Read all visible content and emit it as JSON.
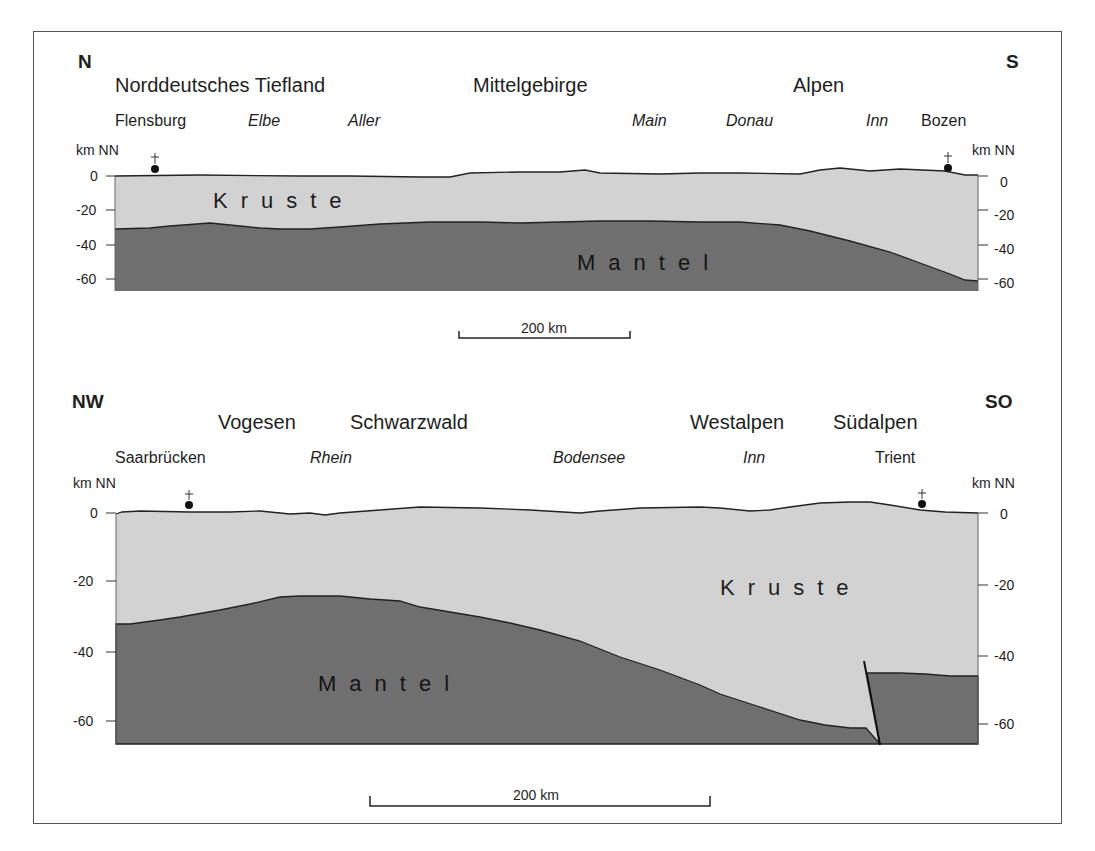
{
  "figure": {
    "type": "geological cross-sections",
    "colors": {
      "crust": "#d2d2d2",
      "mantle": "#6f6f6f",
      "outline": "#222222",
      "frame": "#555555"
    }
  },
  "section1": {
    "dir_left": "N",
    "dir_right": "S",
    "regions": [
      "Norddeutsches Tiefland",
      "Mittelgebirge",
      "Alpen"
    ],
    "places": [
      "Flensburg",
      "Bozen"
    ],
    "rivers": [
      "Elbe",
      "Aller",
      "Main",
      "Donau",
      "Inn"
    ],
    "axis_unit": "km NN",
    "ticks": [
      "0",
      "-20",
      "-40",
      "-60"
    ],
    "layers": {
      "crust": "Kruste",
      "mantle": "Mantel"
    },
    "scale": "200 km"
  },
  "section2": {
    "dir_left": "NW",
    "dir_right": "SO",
    "regions": [
      "Vogesen",
      "Schwarzwald",
      "Westalpen",
      "Südalpen"
    ],
    "places": [
      "Saarbrücken",
      "Trient"
    ],
    "rivers": [
      "Rhein",
      "Bodensee",
      "Inn"
    ],
    "axis_unit": "km NN",
    "ticks": [
      "0",
      "-20",
      "-40",
      "-60"
    ],
    "layers": {
      "crust": "Kruste",
      "mantle": "Mantel"
    },
    "scale": "200 km"
  }
}
